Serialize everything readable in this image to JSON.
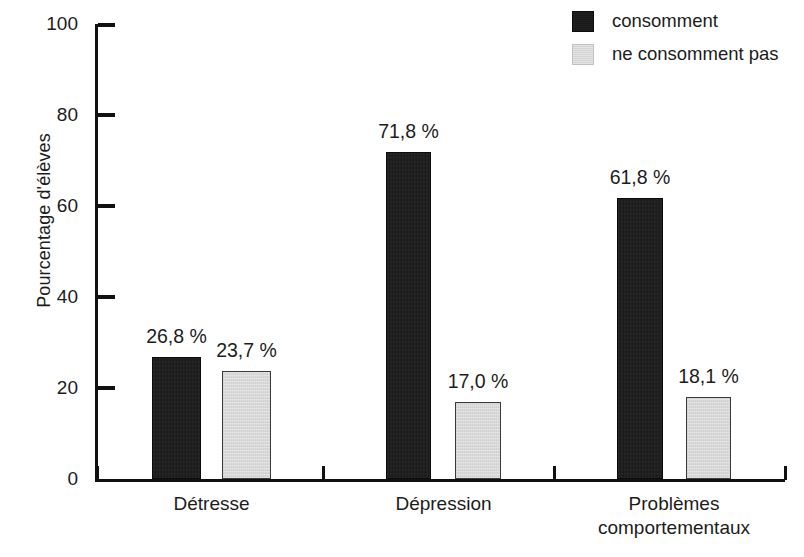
{
  "chart_data": {
    "type": "bar",
    "title": "",
    "subtitle": "",
    "xlabel": "",
    "ylabel": "Pourcentage d'élèves",
    "ylim": [
      0,
      100
    ],
    "yticks": [
      0,
      20,
      40,
      60,
      80,
      100
    ],
    "ytick_labels": [
      "0",
      "20",
      "40",
      "60",
      "80",
      "100"
    ],
    "grid": false,
    "legend_position": "top-right",
    "categories": [
      "Détresse",
      "Dépression",
      "Problèmes\ncomportementaux"
    ],
    "category_labels": [
      {
        "line1": "Détresse",
        "line2": ""
      },
      {
        "line1": "Dépression",
        "line2": ""
      },
      {
        "line1": "Problèmes",
        "line2": "comportementaux"
      }
    ],
    "series": [
      {
        "name": "consomment",
        "color": "#161616",
        "values": [
          26.8,
          71.8,
          61.8
        ],
        "value_labels": [
          "26,8 %",
          "71,8 %",
          "61,8 %"
        ]
      },
      {
        "name": "ne consomment pas",
        "color": "#d2d2d2",
        "values": [
          23.7,
          17.0,
          18.1
        ],
        "value_labels": [
          "23,7 %",
          "17,0 %",
          "18,1 %"
        ]
      }
    ]
  },
  "legend": {
    "items": [
      {
        "label": "consomment",
        "swatch": "legend-swatch-dark"
      },
      {
        "label": "ne consomment pas",
        "swatch": "legend-swatch-light"
      }
    ]
  },
  "colors": {
    "series_dark": "#161616",
    "series_light": "#d2d2d2",
    "axis": "#111111",
    "text": "#1c1c1c",
    "background": "#ffffff"
  }
}
